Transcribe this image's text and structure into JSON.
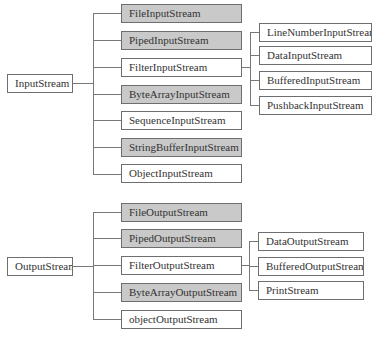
{
  "colors": {
    "shaded_fill": "#c9c9c9",
    "border": "#6e6e6e",
    "line": "#777777"
  },
  "input": {
    "root": "InputStream",
    "children": [
      {
        "label": "FileInputStream",
        "shaded": true
      },
      {
        "label": "PipedInputStream",
        "shaded": true
      },
      {
        "label": "FilterInputStream",
        "shaded": false
      },
      {
        "label": "ByteArrayInputStream",
        "shaded": true
      },
      {
        "label": "SequenceInputStream",
        "shaded": false
      },
      {
        "label": "StringBufferInputStream",
        "shaded": true
      },
      {
        "label": "ObjectInputStream",
        "shaded": false
      }
    ],
    "filter_children": [
      "LineNumberInputStream",
      "DataInputStream",
      "BufferedInputStream",
      "PushbackInputStream"
    ]
  },
  "output": {
    "root": "OutputStream",
    "children": [
      {
        "label": "FileOutputStream",
        "shaded": true
      },
      {
        "label": "PipedOutputStream",
        "shaded": true
      },
      {
        "label": "FilterOutputStream",
        "shaded": false
      },
      {
        "label": "ByteArrayOutputStream",
        "shaded": true
      },
      {
        "label": "objectOutputStream",
        "shaded": false
      }
    ],
    "filter_children": [
      "DataOutputStream",
      "BufferedOutputStream",
      "PrintStream"
    ]
  }
}
